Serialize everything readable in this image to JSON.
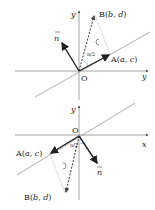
{
  "diagrams": [
    {
      "id": "top",
      "axis_x_label": "x",
      "axis_y_label": "y",
      "origin_label": "O",
      "point_A": {
        "name": "A",
        "coords": "(a, c)",
        "label_prefix": "A(",
        "v1": "a",
        "sep": ", ",
        "v2": "c",
        "suffix": ")"
      },
      "point_B": {
        "name": "B",
        "coords": "(b, d)",
        "label_prefix": "B(",
        "v1": "b",
        "sep": ", ",
        "v2": "d",
        "suffix": ")"
      },
      "normal_vector": "n",
      "angle_label": "π/2",
      "rotation": "counterclockwise"
    },
    {
      "id": "bottom",
      "axis_x_label": "x",
      "axis_y_label": "y",
      "origin_label": "O",
      "point_A": {
        "name": "A",
        "coords": "(a, c)",
        "label_prefix": "A(",
        "v1": "a",
        "sep": ", ",
        "v2": "c",
        "suffix": ")"
      },
      "point_B": {
        "name": "B",
        "coords": "(b, d)",
        "label_prefix": "B(",
        "v1": "b",
        "sep": ", ",
        "v2": "d",
        "suffix": ")"
      },
      "normal_vector": "n",
      "angle_label": "π/2",
      "rotation": "counterclockwise"
    }
  ],
  "colors": {
    "line": "#333333",
    "axis": "#555555",
    "arc": "#7fb0d8",
    "dashed": "#444444"
  }
}
